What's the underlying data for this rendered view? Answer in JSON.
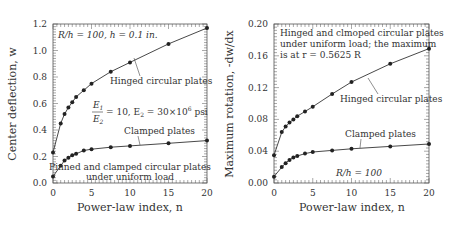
{
  "chart_data": [
    {
      "type": "line",
      "title": "",
      "xlabel": "Power-law index, n",
      "ylabel": "Center deflection, w",
      "xlim": [
        0,
        20
      ],
      "ylim": [
        0,
        1.2
      ],
      "xticks": [
        0,
        5,
        10,
        15,
        20
      ],
      "yticks": [
        "0.0",
        "0.2",
        "0.4",
        "0.6",
        "0.8",
        "1.0",
        "1.2"
      ],
      "x": [
        0,
        1,
        1.5,
        2,
        2.5,
        3,
        4,
        5,
        7.5,
        10,
        15,
        20
      ],
      "series": [
        {
          "name": "Hinged circular plates",
          "values": [
            0.23,
            0.45,
            0.52,
            0.57,
            0.61,
            0.65,
            0.7,
            0.75,
            0.84,
            0.91,
            1.05,
            1.17
          ]
        },
        {
          "name": "Clamped plates",
          "values": [
            0.05,
            0.13,
            0.17,
            0.19,
            0.21,
            0.22,
            0.245,
            0.255,
            0.27,
            0.28,
            0.3,
            0.32
          ]
        }
      ],
      "annotations": [
        "R/h = 100,   h = 0.1 in.",
        "E1/E2 = 10,  E2 = 30×10^6 psi",
        "Pinned and clamped circular plates",
        "under uniform load"
      ],
      "grid": false
    },
    {
      "type": "line",
      "title": "",
      "xlabel": "Power-law index, n",
      "ylabel": "Maximum rotation, -dw/dx",
      "xlim": [
        0,
        20
      ],
      "ylim": [
        0,
        0.2
      ],
      "xticks": [
        0,
        5,
        10,
        15,
        20
      ],
      "yticks": [
        "0.00",
        "0.04",
        "0.08",
        "0.12",
        "0.16",
        "0.20"
      ],
      "x": [
        0,
        1,
        1.5,
        2,
        2.5,
        3,
        4,
        5,
        7.5,
        10,
        15,
        20
      ],
      "series": [
        {
          "name": "Hinged circular plates",
          "values": [
            0.035,
            0.064,
            0.071,
            0.076,
            0.08,
            0.084,
            0.09,
            0.096,
            0.112,
            0.127,
            0.15,
            0.169
          ]
        },
        {
          "name": "Clamped plates",
          "values": [
            0.008,
            0.02,
            0.025,
            0.029,
            0.032,
            0.034,
            0.037,
            0.039,
            0.041,
            0.043,
            0.046,
            0.049
          ]
        }
      ],
      "annotations": [
        "Hinged and clmoped circular plates",
        "under uniform load; the maximum",
        "is at r = 0.5625 R",
        "R/h = 100"
      ],
      "grid": false
    }
  ],
  "left": {
    "ylabel": "Center deflection, w",
    "xlabel": "Power-law index, n",
    "note1": "R/h = 100,   h = 0.1 in.",
    "frac_num": "E",
    "frac_num_sub": "1",
    "frac_den": "E",
    "frac_den_sub": "2",
    "frac_rest": "= 10,  E",
    "frac_rest_sub": "2",
    "frac_rest2": " = 30×10",
    "frac_rest_sup": "6",
    "frac_rest3": " psi",
    "hinged_label": "Hinged circular plates",
    "clamped_label": "Clamped plates",
    "bottom_note1": "Pinned and clamped circular plates",
    "bottom_note2": "under uniform load"
  },
  "right": {
    "ylabel": "Maximum rotation, -dw/dx",
    "xlabel": "Power-law index, n",
    "note1": "Hinged and clmoped circular plates",
    "note2": "under uniform load; the maximum",
    "note3": "is at r = 0.5625 R",
    "hinged_label": "Hinged circular plates",
    "clamped_label": "Clamped plates",
    "rh_note": "R/h = 100"
  }
}
